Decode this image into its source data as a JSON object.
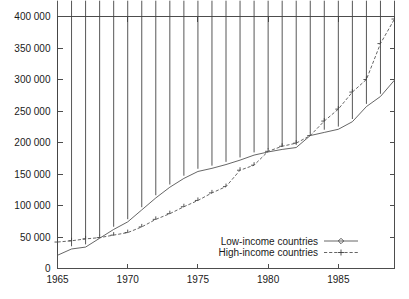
{
  "chart_data": {
    "type": "line",
    "title": "",
    "subtitle": "",
    "xlabel": "",
    "ylabel": "",
    "xlim": [
      1965,
      1989
    ],
    "ylim": [
      0,
      400000
    ],
    "grid": false,
    "legend_position": "inside-bottom-right",
    "x_ticks": [
      "1965",
      "1970",
      "1975",
      "1980",
      "1985"
    ],
    "x_tick_values": [
      1965,
      1970,
      1975,
      1980,
      1985
    ],
    "y_ticks": [
      "0",
      "50 000",
      "100 000",
      "150 000",
      "200 000",
      "250 000",
      "300 000",
      "350 000",
      "400 000"
    ],
    "y_tick_values": [
      0,
      50000,
      100000,
      150000,
      200000,
      250000,
      300000,
      350000,
      400000
    ],
    "x": [
      1965,
      1966,
      1967,
      1968,
      1969,
      1970,
      1971,
      1972,
      1973,
      1974,
      1975,
      1976,
      1977,
      1978,
      1979,
      1980,
      1981,
      1982,
      1983,
      1984,
      1985,
      1986,
      1987,
      1988,
      1989
    ],
    "series": [
      {
        "name": "Low-income countries",
        "marker": "diamond",
        "linestyle": "solid",
        "color": "#555555",
        "values": [
          21000,
          31000,
          34000,
          48000,
          62000,
          74000,
          93000,
          112000,
          129000,
          143000,
          154000,
          159000,
          165000,
          172000,
          180000,
          185000,
          189000,
          192000,
          211000,
          216000,
          221000,
          233000,
          257000,
          273000,
          299000
        ]
      },
      {
        "name": "High-income countries",
        "marker": "plus",
        "linestyle": "dashed",
        "color": "#555555",
        "values": [
          42000,
          44000,
          47000,
          49000,
          53000,
          57000,
          66000,
          78000,
          87000,
          98000,
          108000,
          120000,
          130000,
          156000,
          164000,
          186000,
          194000,
          199000,
          211000,
          234000,
          253000,
          280000,
          300000,
          357000,
          396000
        ]
      }
    ]
  },
  "legend": {
    "entries": [
      {
        "label": "Low-income countries",
        "marker": "diamond-icon",
        "linestyle": "solid"
      },
      {
        "label": "High-income countries",
        "marker": "plus-icon",
        "linestyle": "dashed"
      }
    ]
  }
}
